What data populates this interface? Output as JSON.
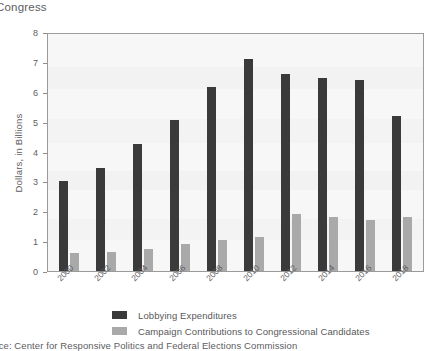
{
  "figure": {
    "title": "Congress",
    "source_note": "urce: Center for Responsive Politics and Federal Elections Commission"
  },
  "legend": {
    "items": [
      {
        "label": "Lobbying Expenditures",
        "color": "#3a3a3a"
      },
      {
        "label": "Campaign Contributions to Congressional Candidates",
        "color": "#a9a9a9"
      }
    ]
  },
  "axes": {
    "y_title": "Dollars, in Billions",
    "y_ticks": [
      "0",
      "1",
      "2",
      "3",
      "4",
      "5",
      "6",
      "7",
      "8"
    ],
    "x_ticks": [
      "2000",
      "2002",
      "2004",
      "2006",
      "2008",
      "2010",
      "2012",
      "2014",
      "2016",
      "2018"
    ]
  },
  "chart_data": {
    "type": "bar",
    "title": "Congress",
    "xlabel": "",
    "ylabel": "Dollars, in Billions",
    "ylim": [
      0,
      8
    ],
    "yticks": [
      0,
      1,
      2,
      3,
      4,
      5,
      6,
      7,
      8
    ],
    "grid": false,
    "legend_position": "below-plot",
    "categories": [
      "2000",
      "2002",
      "2004",
      "2006",
      "2008",
      "2010",
      "2012",
      "2014",
      "2016",
      "2018"
    ],
    "series": [
      {
        "name": "Lobbying Expenditures",
        "color": "#3a3a3a",
        "values": [
          3.0,
          3.45,
          4.25,
          5.05,
          6.15,
          7.1,
          6.6,
          6.45,
          6.4,
          5.2
        ]
      },
      {
        "name": "Campaign Contributions to Congressional Candidates",
        "color": "#a9a9a9",
        "values": [
          0.6,
          0.65,
          0.75,
          0.9,
          1.05,
          1.15,
          1.9,
          1.8,
          1.7,
          1.8
        ]
      }
    ],
    "annotations": [
      "urce: Center for Responsive Politics and Federal Elections Commission"
    ]
  }
}
